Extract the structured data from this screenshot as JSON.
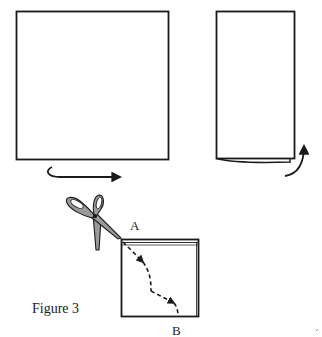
{
  "diagram": {
    "title": "Figure 3",
    "labels": {
      "start_point": "A",
      "end_point": "B"
    },
    "steps": [
      {
        "id": 1,
        "shape": "square sheet",
        "action": "fold left to right"
      },
      {
        "id": 2,
        "shape": "folded rectangle",
        "action": "fold bottom up"
      },
      {
        "id": 3,
        "shape": "folded square",
        "action": "cut along dashed line from A to B"
      }
    ],
    "icons": [
      "curved-arrow-right",
      "curved-arrow-up",
      "scissors",
      "dashed-cut-line"
    ],
    "colors": {
      "line": "#1a1a1a",
      "scissors_fill": "#9a9a9a",
      "background": "#ffffff"
    }
  }
}
